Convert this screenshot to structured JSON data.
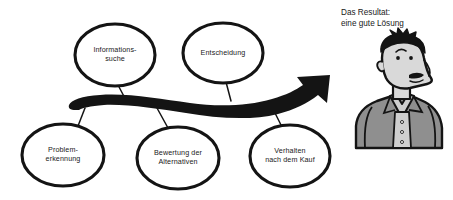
{
  "diagram": {
    "title_caption": "Das Resultat:\neine gute Lösung",
    "nodes": [
      {
        "id": "informationssuche",
        "label": "Informations-\nsuche",
        "row": "top",
        "cx": 115,
        "cy": 55
      },
      {
        "id": "entscheidung",
        "label": "Entscheidung",
        "row": "top",
        "cx": 223,
        "cy": 53
      },
      {
        "id": "problemerkennung",
        "label": "Problem-\nerkennung",
        "row": "bottom",
        "cx": 63,
        "cy": 155
      },
      {
        "id": "bewertung-der-alternativen",
        "label": "Bewertung der\nAlternativen",
        "row": "bottom",
        "cx": 178,
        "cy": 158
      },
      {
        "id": "verhalten-nach-dem-kauf",
        "label": "Verhalten\nnach dem Kauf",
        "row": "bottom",
        "cx": 290,
        "cy": 156
      }
    ],
    "arrow": {
      "name": "process-flow-arrow",
      "direction": "left-to-right-upward",
      "style": "thick-wavy-band"
    },
    "figure": {
      "name": "businessman-figure",
      "description": "cartoon man with spiky hair, mustache and suit"
    },
    "colors": {
      "ink": "#111111",
      "background": "#ffffff",
      "skin": "#d9d9d9",
      "shirt": "#cfcfcf",
      "jacket": "#8f8f8f",
      "hair": "#111111"
    }
  }
}
